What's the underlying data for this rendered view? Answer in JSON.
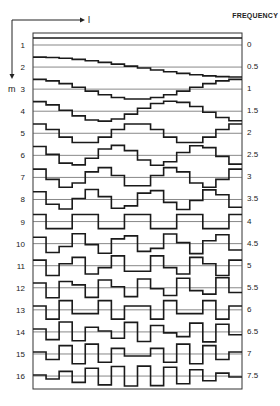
{
  "diagram": {
    "header": {
      "frequency_label": "FREQUENCY"
    },
    "axes": {
      "horizontal_label": "l",
      "vertical_label": "m"
    },
    "rows": [
      {
        "m": "1",
        "frequency": "0"
      },
      {
        "m": "2",
        "frequency": "0.5"
      },
      {
        "m": "3",
        "frequency": "1"
      },
      {
        "m": "4",
        "frequency": "1.5"
      },
      {
        "m": "5",
        "frequency": "2"
      },
      {
        "m": "6",
        "frequency": "2.5"
      },
      {
        "m": "7",
        "frequency": "3"
      },
      {
        "m": "8",
        "frequency": "3.5"
      },
      {
        "m": "9",
        "frequency": "4"
      },
      {
        "m": "10",
        "frequency": "4.5"
      },
      {
        "m": "11",
        "frequency": "5"
      },
      {
        "m": "12",
        "frequency": "5.5"
      },
      {
        "m": "13",
        "frequency": "6"
      },
      {
        "m": "14",
        "frequency": "6.5"
      },
      {
        "m": "15",
        "frequency": "7"
      },
      {
        "m": "16",
        "frequency": "7.5"
      }
    ],
    "samples_per_row": 16,
    "waveform": "sampled cosine (DCT basis), staircase",
    "colors": {
      "line": "#1a1a1a",
      "baseline": "#555555",
      "frame": "#333333"
    }
  }
}
